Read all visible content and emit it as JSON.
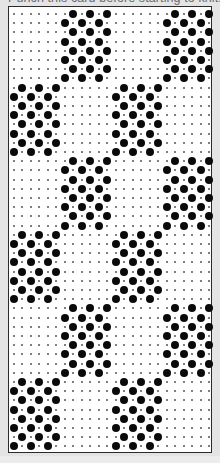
{
  "title": "Punch this card before starting to knit.",
  "card": {
    "columns": 24,
    "rows": 48,
    "block_rows": 8,
    "block_sequence": [
      "A",
      "B",
      "A",
      "B",
      "A",
      "B"
    ],
    "motifs": {
      "A": {
        "even_row_holes": [
          7,
          9,
          11,
          19,
          21,
          23
        ],
        "odd_row_holes": [
          6,
          8,
          10,
          18,
          20,
          22
        ]
      },
      "B": {
        "even_row_holes": [
          1,
          3,
          5,
          13,
          15,
          17
        ],
        "odd_row_holes": [
          0,
          2,
          4,
          12,
          14,
          16
        ]
      }
    }
  },
  "colors": {
    "background": "#e4e4e4",
    "card": "#ffffff",
    "hole": "#0a0a0a",
    "guide_dot": "#555555"
  }
}
